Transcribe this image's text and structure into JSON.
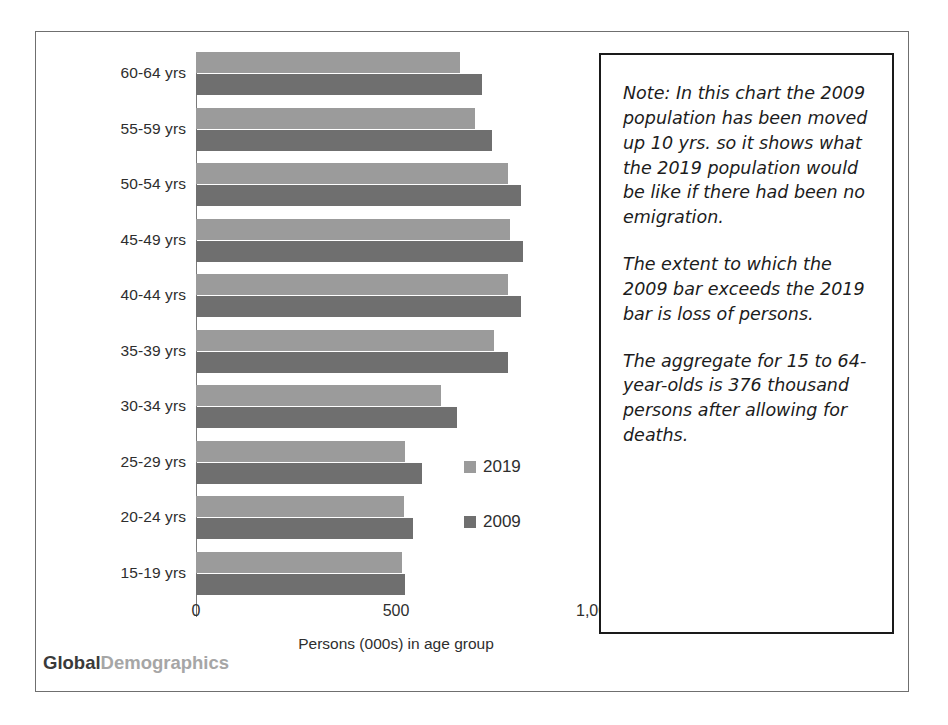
{
  "chart_data": {
    "type": "bar",
    "orientation": "horizontal",
    "title": "",
    "xlabel": "Persons (000s) in age group",
    "ylabel": "",
    "categories": [
      "60-64 yrs",
      "55-59 yrs",
      "50-54 yrs",
      "45-49 yrs",
      "40-44 yrs",
      "35-39 yrs",
      "30-34 yrs",
      "25-29 yrs",
      "20-24 yrs",
      "15-19 yrs"
    ],
    "series": [
      {
        "name": "2019",
        "color": "#9b9b9b",
        "values": [
          661,
          697,
          779,
          785,
          779,
          744,
          612,
          523,
          520,
          515
        ]
      },
      {
        "name": "2009",
        "color": "#6f6f6f",
        "values": [
          716,
          741,
          813,
          818,
          813,
          779,
          653,
          565,
          542,
          523
        ]
      }
    ],
    "xlim": [
      0,
      1000
    ],
    "xticks": [
      0,
      500,
      1000
    ],
    "xticklabels": [
      "0",
      "500",
      "1,000"
    ],
    "grid": false,
    "legend_position": "center-right"
  },
  "axis": {
    "tick_labels": [
      "0",
      "500",
      "1,000"
    ],
    "title": "Persons (000s) in age group"
  },
  "legend": {
    "items": [
      {
        "label": "2019",
        "color": "#9b9b9b"
      },
      {
        "label": "2009",
        "color": "#6f6f6f"
      }
    ]
  },
  "brand": {
    "part1": "Global",
    "part2": "Demographics"
  },
  "note": {
    "paragraphs": [
      "Note: In this chart the 2009 population has been moved up 10 yrs. so it shows what the 2019 population would be like if there had been no emigration.",
      "The extent to which the 2009 bar exceeds the 2019 bar is loss of persons.",
      "The aggregate for 15 to 64-year-olds is 376 thousand persons after allowing for deaths."
    ]
  }
}
